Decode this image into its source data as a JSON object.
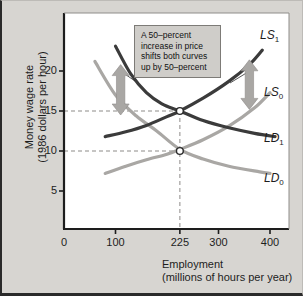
{
  "chart_data": {
    "type": "line",
    "title": "",
    "xlabel": "Employment",
    "xlabel_sub": "(millions of hours per year)",
    "ylabel": "Money wage rate",
    "ylabel_sub": "(1986 dollars per hour)",
    "xlim": [
      0,
      450
    ],
    "ylim": [
      0,
      25
    ],
    "grid": false,
    "legend_position": "inline-curve-labels",
    "xticks": [
      0,
      100,
      225,
      300,
      400
    ],
    "xtick_labels": [
      "0",
      "100",
      "225",
      "300",
      "400"
    ],
    "yticks": [
      5,
      10,
      15,
      20
    ],
    "ytick_labels": [
      "5",
      "10",
      "15",
      "20"
    ],
    "series": [
      {
        "name": "LD0",
        "label": "LD",
        "label_sub": "0",
        "color": "#a9a7a4",
        "kind": "demand",
        "points": [
          [
            60,
            21.2
          ],
          [
            100,
            17.0
          ],
          [
            140,
            14.4
          ],
          [
            180,
            12.5
          ],
          [
            225,
            10.2
          ],
          [
            270,
            9.0
          ],
          [
            320,
            8.1
          ],
          [
            380,
            7.4
          ],
          [
            400,
            7.2
          ]
        ]
      },
      {
        "name": "LS0",
        "label": "LS",
        "label_sub": "0",
        "color": "#a9a7a4",
        "kind": "supply",
        "points": [
          [
            80,
            7.2
          ],
          [
            120,
            8.1
          ],
          [
            160,
            8.9
          ],
          [
            200,
            9.6
          ],
          [
            225,
            10.2
          ],
          [
            270,
            11.4
          ],
          [
            320,
            13.1
          ],
          [
            370,
            15.4
          ],
          [
            400,
            17.3
          ]
        ]
      },
      {
        "name": "LD1",
        "label": "LD",
        "label_sub": "1",
        "color": "#3b3b3b",
        "kind": "demand",
        "points": [
          [
            100,
            23.1
          ],
          [
            130,
            19.6
          ],
          [
            160,
            17.3
          ],
          [
            190,
            15.9
          ],
          [
            225,
            15.0
          ],
          [
            270,
            13.8
          ],
          [
            320,
            12.9
          ],
          [
            370,
            12.2
          ],
          [
            410,
            11.8
          ]
        ]
      },
      {
        "name": "LS1",
        "label": "LS",
        "label_sub": "1",
        "color": "#3b3b3b",
        "kind": "supply",
        "points": [
          [
            80,
            11.8
          ],
          [
            120,
            12.4
          ],
          [
            160,
            13.2
          ],
          [
            200,
            14.3
          ],
          [
            225,
            15.0
          ],
          [
            270,
            16.6
          ],
          [
            320,
            18.7
          ],
          [
            360,
            20.8
          ],
          [
            385,
            22.6
          ]
        ]
      }
    ],
    "equilibria": [
      {
        "name": "initial-equilibrium",
        "x": 225,
        "y": 10,
        "marker": "open-circle"
      },
      {
        "name": "new-equilibrium",
        "x": 225,
        "y": 15,
        "marker": "open-circle"
      }
    ],
    "reference_lines": [
      {
        "name": "wage-15-guide",
        "orientation": "horizontal",
        "value": 15,
        "style": "dashed"
      },
      {
        "name": "wage-10-guide",
        "orientation": "horizontal",
        "value": 10,
        "style": "dashed"
      },
      {
        "name": "employment-225-guide",
        "orientation": "vertical",
        "value": 225,
        "style": "dashed"
      }
    ],
    "shift_arrows": [
      {
        "name": "left-shift-arrow",
        "x": 110,
        "from_y": 14.5,
        "to_y": 20.8,
        "direction": "double",
        "color": "#a9a7a4"
      },
      {
        "name": "right-shift-arrow",
        "x": 360,
        "from_y": 15.2,
        "to_y": 21.4,
        "direction": "double",
        "color": "#a9a7a4"
      }
    ],
    "annotation": {
      "text": "A 50–percent increase in price shifts both curves up by 50–percent",
      "lines": [
        "A 50–percent",
        "increase in price",
        "shifts both curves",
        "up by 50–percent"
      ]
    }
  },
  "colors": {
    "page_background": "#d7d5d1",
    "plot_background": "#ffffff",
    "axis": "#1d1d1d",
    "curve_dark": "#3b3b3b",
    "curve_light": "#a9a7a4",
    "guide_line": "#8d8b88",
    "annotation_fill": "#cfcdc9",
    "annotation_border": "#7d7b77"
  }
}
